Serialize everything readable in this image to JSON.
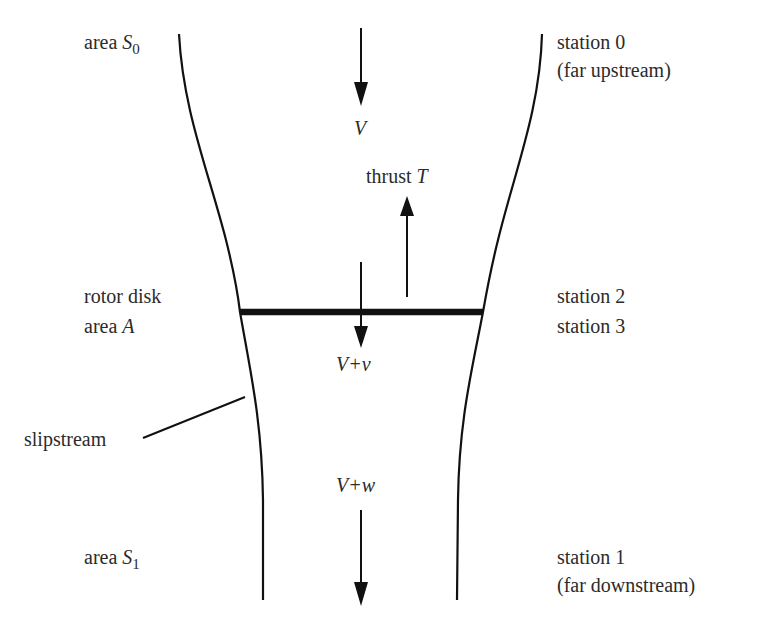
{
  "diagram": {
    "labels": {
      "area_s0": {
        "prefix": "area ",
        "symbol": "S",
        "sub": "0"
      },
      "area_s1": {
        "prefix": "area ",
        "symbol": "S",
        "sub": "1"
      },
      "rotor_disk": "rotor disk",
      "area_a": {
        "prefix": "area ",
        "symbol": "A"
      },
      "slipstream": "slipstream",
      "station0": "station 0",
      "station0_note": "(far upstream)",
      "station2": "station 2",
      "station3": "station 3",
      "station1": "station 1",
      "station1_note": "(far downstream)",
      "velocity_v": "V",
      "thrust": {
        "prefix": "thrust ",
        "symbol": "T"
      },
      "velocity_v_plus_v": "V+v",
      "velocity_v_plus_w": "V+w"
    },
    "colors": {
      "stroke": "#111111",
      "text": "#2b2b2b",
      "background": "#ffffff"
    }
  }
}
